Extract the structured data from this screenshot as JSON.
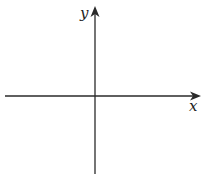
{
  "diagram": {
    "type": "cartesian-axes",
    "origin": {
      "x": 95,
      "y": 96
    },
    "colors": {
      "axis": "#2a2a2a",
      "background": "#ffffff"
    },
    "x_axis": {
      "label": "x",
      "from": 5,
      "to": 201,
      "arrow": "right"
    },
    "y_axis": {
      "label": "y",
      "from": 174,
      "to": 6,
      "arrow": "up"
    }
  }
}
